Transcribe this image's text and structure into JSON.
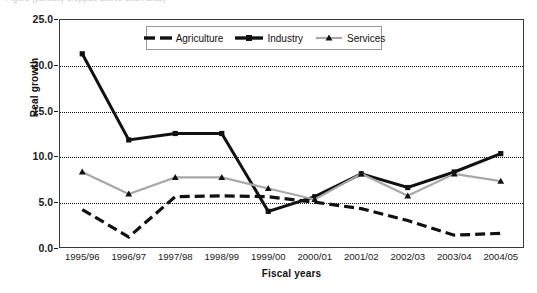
{
  "figure": {
    "cropped_caption": "Figure (partially cropped above chart area)"
  },
  "chart_data": {
    "type": "line",
    "title": "",
    "xlabel": "Fiscal years",
    "ylabel": "Real growth",
    "ylim": [
      0.0,
      25.0
    ],
    "yticks": [
      "0.0",
      "5.0",
      "10.0",
      "15.0",
      "20.0",
      "25.0"
    ],
    "ytick_values": [
      0.0,
      5.0,
      10.0,
      15.0,
      20.0,
      25.0
    ],
    "grid": "horizontal-dotted",
    "legend_position": "top-center",
    "categories": [
      "1995/96",
      "1996/97",
      "1997/98",
      "1998/99",
      "1999/00",
      "2000/01",
      "2001/02",
      "2002/03",
      "2003/04",
      "2004/05"
    ],
    "series": [
      {
        "name": "Agriculture",
        "color": "#111111",
        "style": "dashed",
        "marker": "none",
        "values": [
          4.2,
          1.2,
          5.6,
          5.7,
          5.6,
          5.0,
          4.3,
          3.0,
          1.4,
          1.6
        ]
      },
      {
        "name": "Industry",
        "color": "#111111",
        "style": "solid",
        "marker": "square",
        "values": [
          21.2,
          11.8,
          12.5,
          12.5,
          4.0,
          5.6,
          8.1,
          6.6,
          8.3,
          10.3
        ]
      },
      {
        "name": "Services",
        "color": "#a8a8a8",
        "style": "solid",
        "marker": "triangle",
        "values": [
          8.3,
          5.9,
          7.7,
          7.7,
          6.5,
          5.3,
          8.1,
          5.7,
          8.1,
          7.3
        ]
      }
    ]
  }
}
